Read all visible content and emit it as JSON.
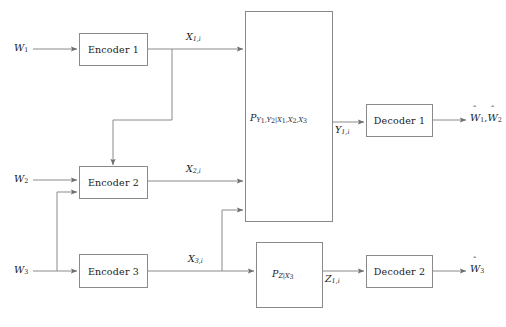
{
  "figure": {
    "type": "block-diagram",
    "background_color": "#ffffff",
    "line_color": "#8a8a8a",
    "text_color": "#1a1a1a"
  },
  "messages": {
    "w1": "W",
    "w1_sub": "1",
    "w2": "W",
    "w2_sub": "2",
    "w3": "W",
    "w3_sub": "3"
  },
  "encoders": [
    {
      "name": "encoder-1",
      "label": "Encoder 1"
    },
    {
      "name": "encoder-2",
      "label": "Encoder 2"
    },
    {
      "name": "encoder-3",
      "label": "Encoder 3"
    }
  ],
  "channel_inputs": [
    {
      "base": "X",
      "sub": "1,i"
    },
    {
      "base": "X",
      "sub": "2,i"
    },
    {
      "base": "X",
      "sub": "3,i"
    }
  ],
  "main_channel": {
    "name": "main-channel",
    "p": "P",
    "outputs": "Y",
    "outputs_sub": "1",
    "outputs_sub2": "2",
    "inputs_sub": "X",
    "label_full": "P",
    "subscript": "Y1,Y2|X1,X2,X3"
  },
  "side_channel": {
    "name": "side-channel",
    "p": "P",
    "subscript": "Z|X3"
  },
  "channel_outputs": [
    {
      "base": "Y",
      "sub": "1,i"
    },
    {
      "base": "Z",
      "sub": "1,i"
    }
  ],
  "decoders": [
    {
      "name": "decoder-1",
      "label": "Decoder 1"
    },
    {
      "name": "decoder-2",
      "label": "Decoder 2"
    }
  ],
  "estimates": {
    "dec1": "W",
    "dec1_sub_a": "1",
    "dec1_sub_b": "2",
    "dec1_sep": ",",
    "dec2": "W",
    "dec2_sub": "3"
  }
}
